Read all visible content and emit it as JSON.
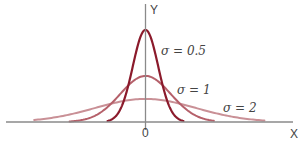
{
  "chart_data": {
    "type": "line",
    "title": "",
    "xlabel": "X",
    "ylabel": "Y",
    "x_tick_labels": [
      "0"
    ],
    "grid": false,
    "legend": "inline labels",
    "xlim": [
      -5.7,
      5.9
    ],
    "ylim": [
      0,
      0.9
    ],
    "series": [
      {
        "name": "σ = 0.5",
        "sigma": 0.5,
        "mean": 0,
        "peak": 0.798,
        "range": [
          -1.5,
          1.5
        ],
        "color": "#8b1a2b",
        "label_x": 0.6,
        "label_y": 0.65
      },
      {
        "name": "σ = 1",
        "sigma": 1,
        "mean": 0,
        "peak": 0.399,
        "range": [
          -3.0,
          2.7
        ],
        "color": "#b5606a",
        "label_x": 1.7,
        "label_y": 0.28
      },
      {
        "name": "σ = 2",
        "sigma": 2,
        "mean": 0,
        "peak": 0.199,
        "range": [
          -4.4,
          4.7
        ],
        "color": "#c99096",
        "label_x": 4.3,
        "label_y": 0.12
      }
    ]
  },
  "labels": {
    "y_axis": "Y",
    "x_axis": "X",
    "origin": "0",
    "s05": "σ = 0.5",
    "s1": "σ = 1",
    "s2": "σ = 2"
  }
}
